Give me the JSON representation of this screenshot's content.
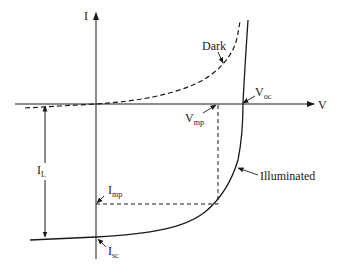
{
  "diagram": {
    "axes": {
      "x_label": "V",
      "y_label": "I"
    },
    "curves": [
      {
        "name": "Dark",
        "style": "dashed"
      },
      {
        "name": "Illuminated",
        "style": "solid"
      }
    ],
    "labels": {
      "dark": "Dark",
      "illuminated": "Illuminated",
      "voc_main": "V",
      "voc_sub": "oc",
      "vmp_main": "V",
      "vmp_sub": "mp",
      "imp_main": "I",
      "imp_sub": "mp",
      "isc_main": "I",
      "isc_sub": "sc",
      "il_main": "I",
      "il_sub": "L"
    },
    "colors": {
      "line": "#1a1a1a",
      "text": "#222222",
      "background": "#ffffff"
    }
  }
}
